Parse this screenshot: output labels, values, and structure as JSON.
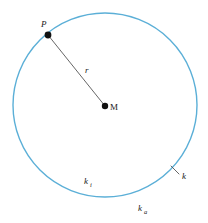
{
  "figure": {
    "type": "geometry-diagram",
    "background_color": "#ffffff"
  },
  "circle": {
    "name": "circle-k",
    "color": "#5bafd7",
    "stroke_width": 1.4,
    "center_x": 105,
    "center_y": 105,
    "radius": 92
  },
  "points": [
    {
      "id": "P",
      "label": "P",
      "x": 48,
      "y": 35,
      "label_x": 41,
      "label_y": 27,
      "dot_radius": 3.4,
      "color": "#111111"
    },
    {
      "id": "M",
      "label": "M",
      "x": 105,
      "y": 106,
      "label_x": 110,
      "label_y": 110,
      "dot_radius": 3.2,
      "color": "#111111"
    }
  ],
  "segments": [
    {
      "id": "radius",
      "label": "r",
      "from": "P",
      "to": "M",
      "x1": 48,
      "y1": 35,
      "x2": 105,
      "y2": 106,
      "color": "#555555",
      "stroke_width": 0.9,
      "label_x": 85,
      "label_y": 73
    }
  ],
  "leader": {
    "name": "leader-line-k",
    "x1": 171,
    "y1": 166,
    "x2": 179,
    "y2": 174,
    "color": "#555555",
    "stroke_width": 0.9
  },
  "labels": {
    "point_p": "P",
    "point_m": "M",
    "radius": "r",
    "inner_region_base": "k",
    "inner_region_sub": "i",
    "outer_region_base": "k",
    "outer_region_sub": "a",
    "curve": "k"
  },
  "label_positions": {
    "inner_region": {
      "x": 84,
      "y": 184
    },
    "outer_region": {
      "x": 138,
      "y": 211
    },
    "curve": {
      "x": 182,
      "y": 179
    }
  },
  "styles": {
    "label_font_size": 9,
    "subscript_font_size": 6.5,
    "text_color": "#1a1a1a"
  }
}
